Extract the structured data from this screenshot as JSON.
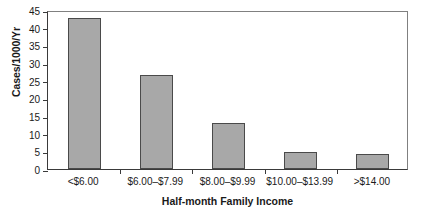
{
  "chart_data": {
    "type": "bar",
    "title": "",
    "xlabel": "Half-month Family Income",
    "ylabel": "Cases/1000/Yr",
    "categories": [
      "<$6.00",
      "$6.00–$7.99",
      "$8.00–$9.99",
      "$10.00–$13.99",
      ">$14.00"
    ],
    "values": [
      42.8,
      26.7,
      13.1,
      4.8,
      4.2
    ],
    "ylim": [
      0,
      45
    ],
    "yticks": [
      0,
      5,
      10,
      15,
      20,
      25,
      30,
      35,
      40,
      45
    ],
    "ytick_labels": [
      "0",
      "5",
      "10",
      "15",
      "20",
      "25",
      "30",
      "35",
      "40",
      "45"
    ],
    "grid": false,
    "legend": null,
    "bar_color": "#a8a8a8",
    "bar_edge_color": "#4a4a4a",
    "axis_color": "#3a3a3a",
    "background": "#ffffff"
  }
}
